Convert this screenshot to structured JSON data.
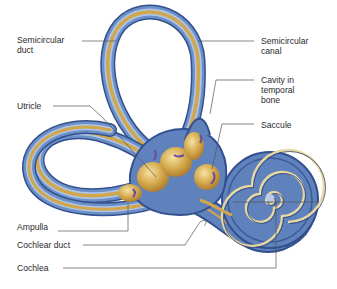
{
  "diagram": {
    "colors": {
      "bony_labyrinth": "#5f82bd",
      "bony_dark": "#33508e",
      "bony_light": "#a9c0e4",
      "membranous": "#d2a64a",
      "membranous_light": "#efd58e",
      "leader_line": "#555555",
      "text": "#2a2a2a"
    },
    "labels_left": [
      {
        "id": "semicircular-duct",
        "text": "Semicircular\nduct"
      },
      {
        "id": "utricle",
        "text": "Utricle"
      },
      {
        "id": "ampulla",
        "text": "Ampulla"
      },
      {
        "id": "cochlear-duct",
        "text": "Cochlear duct"
      },
      {
        "id": "cochlea",
        "text": "Cochlea"
      }
    ],
    "labels_right": [
      {
        "id": "semicircular-canal",
        "text": "Semicircular\ncanal"
      },
      {
        "id": "cavity-in-temporal-bone",
        "text": "Cavity in\ntemporal\nbone"
      },
      {
        "id": "saccule",
        "text": "Saccule"
      }
    ]
  }
}
